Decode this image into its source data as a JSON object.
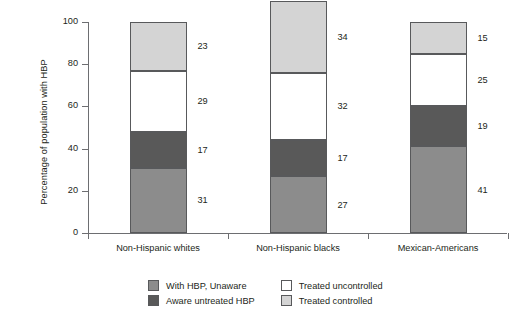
{
  "chart_data": {
    "type": "bar",
    "stacked": true,
    "title": "",
    "xlabel": "",
    "ylabel": "Percentage of population with HBP",
    "ylim": [
      0,
      100
    ],
    "yticks": [
      0,
      20,
      40,
      60,
      80,
      100
    ],
    "grid": false,
    "legend_position": "bottom",
    "categories": [
      "Non-Hispanic whites",
      "Non-Hispanic blacks",
      "Mexican-Americans"
    ],
    "series": [
      {
        "name": "With HBP, Unaware",
        "color": "#8c8c8c",
        "values": [
          31,
          27,
          41
        ]
      },
      {
        "name": "Aware untreated HBP",
        "color": "#595959",
        "values": [
          17,
          17,
          19
        ]
      },
      {
        "name": "Treated uncontrolled",
        "color": "#ffffff",
        "values": [
          29,
          32,
          25
        ]
      },
      {
        "name": "Treated controlled",
        "color": "#d4d4d4",
        "values": [
          23,
          34,
          15
        ]
      }
    ]
  },
  "legend": {
    "items": [
      {
        "label": "With HBP, Unaware",
        "color": "#8c8c8c"
      },
      {
        "label": "Treated uncontrolled",
        "color": "#ffffff"
      },
      {
        "label": "Aware untreated HBP",
        "color": "#595959"
      },
      {
        "label": "Treated controlled",
        "color": "#d4d4d4"
      }
    ]
  },
  "colors": {
    "axis": "#6d6e71",
    "outline": "#58595b",
    "text": "#231f20",
    "background": "#ffffff"
  }
}
